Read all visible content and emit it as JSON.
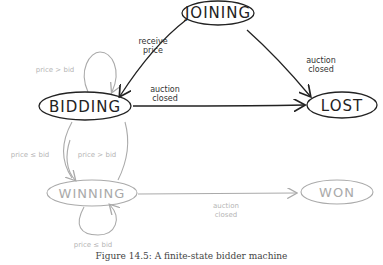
{
  "diagram": {
    "states": {
      "joining": "JOINING",
      "bidding": "BIDDING",
      "lost": "LOST",
      "winning": "WINNING",
      "won": "WON"
    },
    "edges": {
      "joining_to_bidding": [
        "receive",
        "price"
      ],
      "joining_to_lost": [
        "auction",
        "closed"
      ],
      "bidding_to_lost": [
        "auction",
        "closed"
      ],
      "bidding_self": "price > bid",
      "winning_to_bidding": "price ≤ bid",
      "bidding_to_winning": "price > bid",
      "winning_self": "price ≤ bid",
      "winning_to_won": [
        "auction",
        "closed"
      ]
    },
    "colors": {
      "active": "#222222",
      "inactive": "#aaaaaa"
    }
  },
  "caption": "Figure 14.5: A finite-state bidder machine"
}
